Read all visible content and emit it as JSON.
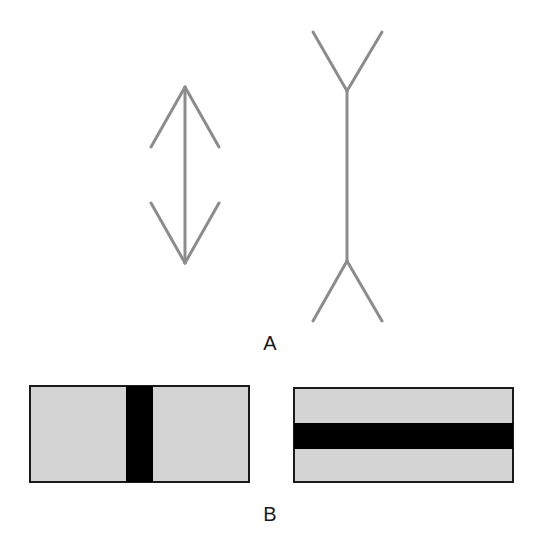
{
  "figure": {
    "panel_a": {
      "label": "A",
      "left_figure": {
        "name": "arrow-outward-fins",
        "shaft": {
          "x": 185,
          "y1": 87,
          "y2": 263
        },
        "fins": [
          {
            "x1": 185,
            "y1": 87,
            "x2": 151,
            "y2": 147
          },
          {
            "x1": 185,
            "y1": 87,
            "x2": 219,
            "y2": 147
          },
          {
            "x1": 185,
            "y1": 263,
            "x2": 151,
            "y2": 203
          },
          {
            "x1": 185,
            "y1": 263,
            "x2": 219,
            "y2": 203
          }
        ]
      },
      "right_figure": {
        "name": "arrow-inward-fins",
        "shaft": {
          "x": 347,
          "y1": 91,
          "y2": 261
        },
        "fins": [
          {
            "x1": 347,
            "y1": 91,
            "x2": 313,
            "y2": 32
          },
          {
            "x1": 347,
            "y1": 91,
            "x2": 382,
            "y2": 32
          },
          {
            "x1": 347,
            "y1": 261,
            "x2": 313,
            "y2": 321
          },
          {
            "x1": 347,
            "y1": 261,
            "x2": 382,
            "y2": 321
          }
        ]
      },
      "line_color": "#8c8c8c"
    },
    "panel_b": {
      "label": "B",
      "left_rect": {
        "x": 30,
        "y": 386,
        "w": 219,
        "h": 96,
        "bar": {
          "orientation": "vertical",
          "x": 126,
          "w": 27
        }
      },
      "right_rect": {
        "x": 294,
        "y": 388,
        "w": 219,
        "h": 94,
        "bar": {
          "orientation": "horizontal",
          "y": 423,
          "h": 26
        }
      },
      "fill_color": "#d4d4d4",
      "bar_color": "#000000",
      "border_color": "#1a1a1a"
    }
  }
}
